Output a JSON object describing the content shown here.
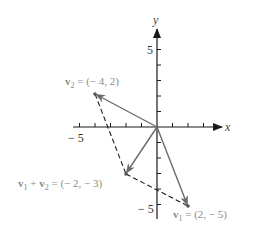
{
  "diagram": {
    "type": "vector-addition-parallelogram",
    "axes": {
      "x_label": "x",
      "y_label": "y",
      "x_tick_label": "− 5",
      "y_tick_label_top": "5",
      "y_tick_label_bottom": "− 5",
      "range": [
        -5,
        5
      ]
    },
    "vectors": [
      {
        "id": "v2",
        "name": "v",
        "sub": "2",
        "rest": " = (− 4,  2)",
        "x": -4,
        "y": 2
      },
      {
        "id": "v1",
        "name": "v",
        "sub": "1",
        "rest": " = (2,  − 5)",
        "x": 2,
        "y": -5
      },
      {
        "id": "sum",
        "name1": "v",
        "sub1": "1",
        "plus": " + ",
        "name2": "v",
        "sub2": "2",
        "rest": " = (− 2,  − 3)",
        "x": -2,
        "y": -3
      }
    ],
    "colors": {
      "axis": "#1a1a1a",
      "vector": "#6a6a6a",
      "label": "#8a8a8a"
    }
  }
}
